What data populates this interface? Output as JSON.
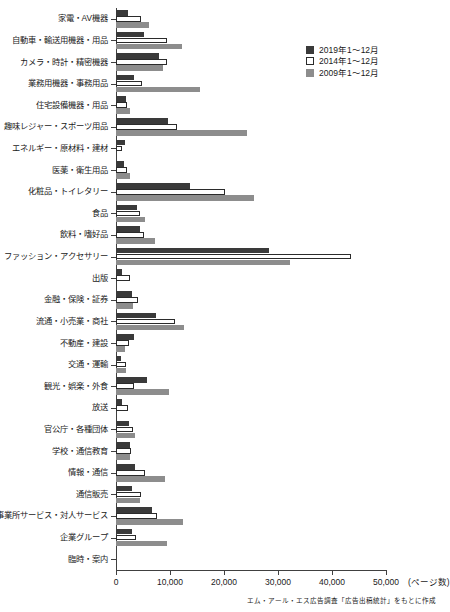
{
  "chart_data": {
    "type": "bar",
    "orientation": "horizontal",
    "title": "",
    "xlabel": "(ページ数)",
    "ylabel": "",
    "xlim": [
      0,
      50000
    ],
    "xticks": [
      0,
      10000,
      20000,
      30000,
      40000,
      50000
    ],
    "xticklabels": [
      "0",
      "10,000",
      "20,000",
      "30,000",
      "40,000",
      "50,000"
    ],
    "grid": false,
    "legend_position": "top-right",
    "categories": [
      "家電・AV機器",
      "自動車・輸送用機器・用品",
      "カメラ・時計・精密機器",
      "業務用機器・事務用品",
      "住宅設備機器・用品",
      "趣味レジャー・スポーツ用品",
      "エネルギー・原材料・建材",
      "医薬・衛生用品",
      "化粧品・トイレタリー",
      "食品",
      "飲料・嗜好品",
      "ファッション・アクセサリー",
      "出版",
      "金融・保険・証券",
      "流通・小売業・商社",
      "不動産・建設",
      "交通・運輸",
      "観光・娯楽・外食",
      "放送",
      "官公庁・各種団体",
      "学校・通信教育",
      "情報・通信",
      "通信販売",
      "事業所サービス・対人サービス",
      "企業グループ",
      "臨時・案内"
    ],
    "series": [
      {
        "name": "2019年1〜12月",
        "color": "#3a3a3a",
        "values": [
          2200,
          5200,
          8000,
          3300,
          1800,
          9600,
          1700,
          1500,
          13700,
          3800,
          4500,
          28400,
          1200,
          3000,
          7400,
          3400,
          900,
          5800,
          1200,
          2400,
          2600,
          3600,
          2900,
          6600,
          3000,
          0
        ]
      },
      {
        "name": "2014年1〜12月",
        "color": "#ffffff",
        "values": [
          4700,
          9400,
          9500,
          4800,
          2100,
          11300,
          1200,
          2000,
          20200,
          4400,
          5200,
          43600,
          2500,
          4000,
          11000,
          2400,
          1900,
          3300,
          2200,
          3100,
          2800,
          5400,
          4600,
          7600,
          3700,
          0
        ]
      },
      {
        "name": "2009年1〜12月",
        "color": "#8d8d8d",
        "values": [
          6100,
          12200,
          8700,
          15500,
          2500,
          24200,
          0,
          2500,
          25600,
          5300,
          7200,
          32200,
          0,
          3100,
          12600,
          1700,
          1800,
          9800,
          0,
          3500,
          2600,
          9100,
          4500,
          12400,
          9500,
          0
        ]
      }
    ],
    "source_note": "エム・アール・エス広告調査「広告出稿統計」をもとに作成"
  }
}
